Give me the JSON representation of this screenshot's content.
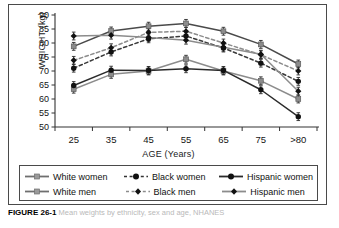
{
  "figure": {
    "caption_label": "FIGURE 26-1",
    "caption_text": "Mean weights by ethnicity, sex and age, NHANES"
  },
  "chart_data": {
    "type": "line",
    "title": "",
    "xlabel": "AGE (Years)",
    "ylabel": "WEIGHT (kg)",
    "categories": [
      "25",
      "35",
      "45",
      "55",
      "65",
      "75",
      ">80"
    ],
    "ylim": [
      50,
      90
    ],
    "yticks": [
      50,
      55,
      60,
      65,
      70,
      75,
      80,
      85,
      90
    ],
    "grid": false,
    "legend_position": "below-plot",
    "error_bars": true,
    "series": [
      {
        "name": "White women",
        "line_style": "solid",
        "color": "#8c8c8c",
        "marker": "square",
        "marker_color": "#8c8c8c",
        "values": [
          63.5,
          68.8,
          70.0,
          74.2,
          70.0,
          66.5,
          60.0
        ]
      },
      {
        "name": "Black women",
        "line_style": "dashed",
        "color": "#3a3a3a",
        "marker": "circle",
        "marker_color": "#111111",
        "values": [
          71.0,
          76.8,
          81.5,
          82.5,
          78.2,
          72.8,
          66.3
        ]
      },
      {
        "name": "Hispanic women",
        "line_style": "solid",
        "color": "#2b2b2b",
        "marker": "circle",
        "marker_color": "#111111",
        "values": [
          64.8,
          70.3,
          70.2,
          70.8,
          70.2,
          63.3,
          53.7
        ]
      },
      {
        "name": "White men",
        "line_style": "solid",
        "color": "#4a4a4a",
        "marker": "square",
        "marker_color": "#8c8c8c",
        "values": [
          78.8,
          84.3,
          86.0,
          87.0,
          84.2,
          79.5,
          72.5
        ]
      },
      {
        "name": "Black men",
        "line_style": "dashed",
        "color": "#8c8c8c",
        "marker": "diamond",
        "marker_color": "#111111",
        "values": [
          73.8,
          78.3,
          83.8,
          84.2,
          80.0,
          75.8,
          70.0
        ]
      },
      {
        "name": "Hispanic men",
        "line_style": "solid",
        "color": "#8c8c8c",
        "marker": "diamond",
        "marker_color": "#111111",
        "values": [
          82.5,
          82.8,
          82.0,
          81.0,
          78.5,
          76.0,
          62.8
        ]
      }
    ]
  },
  "legend": {
    "row1": [
      {
        "label": "White women",
        "key": "solid-square-gray"
      },
      {
        "label": "Black women",
        "key": "dashed-circle-black"
      },
      {
        "label": "Hispanic women",
        "key": "solid-circle-black"
      }
    ],
    "row2": [
      {
        "label": "White men",
        "key": "solid-square-gray"
      },
      {
        "label": "Black men",
        "key": "dashed-diamond-black"
      },
      {
        "label": "Hispanic men",
        "key": "solid-diamond-black"
      }
    ]
  }
}
